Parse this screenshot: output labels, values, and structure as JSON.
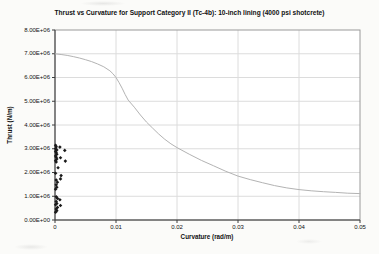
{
  "chart": {
    "title": "Thrust vs Curvature for Support Category II (Tc-4b): 10-inch lining (4000 psi shotcrete)",
    "xlabel": "Curvature (rad/m)",
    "ylabel": "Thrust (N/m)"
  },
  "colors": {
    "plot_bg": "#ffffff",
    "grid": "#dcdcdc",
    "border": "#9a9a9a",
    "axis": "#3c3c3c",
    "curve": "#b3b3b3",
    "marker": "#1a1a1a"
  },
  "chart_data": {
    "type": "line",
    "title": "Thrust vs Curvature for Support Category II (Tc-4b): 10-inch lining (4000 psi shotcrete)",
    "xlabel": "Curvature (rad/m)",
    "ylabel": "Thrust (N/m)",
    "xlim": [
      0,
      0.05
    ],
    "ylim": [
      0,
      8000000
    ],
    "x_ticks": [
      0,
      0.01,
      0.02,
      0.03,
      0.04,
      0.05
    ],
    "x_tick_labels": [
      "0",
      "0.01",
      "0.02",
      "0.03",
      "0.04",
      "0.05"
    ],
    "y_ticks": [
      0,
      1000000,
      2000000,
      3000000,
      4000000,
      5000000,
      6000000,
      7000000,
      8000000
    ],
    "y_tick_labels": [
      "0.00E+00",
      "1.00E+06",
      "2.00E+06",
      "3.00E+06",
      "4.00E+06",
      "5.00E+06",
      "6.00E+06",
      "7.00E+06",
      "8.00E+06"
    ],
    "grid": true,
    "legend": "none",
    "series": [
      {
        "name": "capacity-curve",
        "type": "line",
        "color": "#b3b3b3",
        "x": [
          0,
          0.001,
          0.002,
          0.003,
          0.004,
          0.005,
          0.006,
          0.007,
          0.008,
          0.009,
          0.0095,
          0.01,
          0.0105,
          0.011,
          0.0115,
          0.012,
          0.013,
          0.014,
          0.015,
          0.016,
          0.017,
          0.018,
          0.019,
          0.02,
          0.022,
          0.024,
          0.026,
          0.028,
          0.03,
          0.032,
          0.034,
          0.036,
          0.038,
          0.04,
          0.042,
          0.044,
          0.046,
          0.048,
          0.05
        ],
        "y": [
          7000000,
          6970000,
          6930000,
          6880000,
          6820000,
          6750000,
          6670000,
          6570000,
          6450000,
          6280000,
          6160000,
          6000000,
          5790000,
          5550000,
          5290000,
          5050000,
          4750000,
          4420000,
          4120000,
          3870000,
          3620000,
          3400000,
          3210000,
          3050000,
          2770000,
          2510000,
          2280000,
          2050000,
          1850000,
          1700000,
          1570000,
          1450000,
          1350000,
          1280000,
          1230000,
          1190000,
          1160000,
          1130000,
          1110000
        ]
      },
      {
        "name": "demand-points",
        "type": "scatter",
        "marker": "diamond",
        "color": "#1a1a1a",
        "points": [
          [
            0.0001,
            3150000
          ],
          [
            0.0002,
            3080000
          ],
          [
            0.0001,
            3000000
          ],
          [
            0.0003,
            2950000
          ],
          [
            0.0001,
            2890000
          ],
          [
            0.0002,
            2830000
          ],
          [
            0.0003,
            2770000
          ],
          [
            0.0001,
            2700000
          ],
          [
            0.0002,
            2640000
          ],
          [
            0.0003,
            2570000
          ],
          [
            0.0001,
            2500000
          ],
          [
            0.0002,
            2440000
          ],
          [
            0.0008,
            3070000
          ],
          [
            0.0016,
            2930000
          ],
          [
            0.0009,
            2620000
          ],
          [
            0.0017,
            2480000
          ],
          [
            0.0005,
            2200000
          ],
          [
            0.0001,
            1970000
          ],
          [
            0.001,
            1870000
          ],
          [
            0.0009,
            1730000
          ],
          [
            0.0002,
            1680000
          ],
          [
            0.0004,
            1590000
          ],
          [
            0.0002,
            1480000
          ],
          [
            0.0003,
            1380000
          ],
          [
            0.0001,
            1300000
          ],
          [
            0.0002,
            980000
          ],
          [
            0.0004,
            910000
          ],
          [
            0.0008,
            850000
          ],
          [
            0.0002,
            780000
          ],
          [
            0.0003,
            700000
          ],
          [
            0.0001,
            640000
          ],
          [
            0.0009,
            610000
          ],
          [
            0.0004,
            530000
          ],
          [
            0.0002,
            460000
          ],
          [
            0.0003,
            390000
          ],
          [
            0.0001,
            330000
          ]
        ]
      }
    ]
  }
}
